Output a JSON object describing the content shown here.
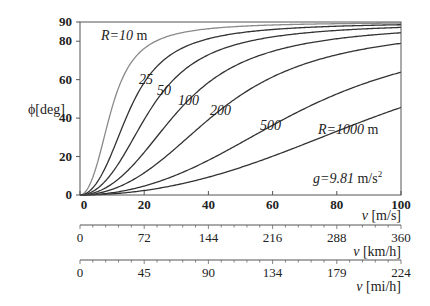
{
  "chart_data": {
    "type": "line",
    "title": "",
    "formula": "phi = atan(v^2 / (g R))",
    "xlabel": "v [m/s]",
    "ylabel": "ϕ[deg]",
    "xlim": [
      0,
      100
    ],
    "ylim": [
      0,
      90
    ],
    "x_ticks": [
      "0",
      "20",
      "40",
      "60",
      "80",
      "100"
    ],
    "y_ticks": [
      "0",
      "20",
      "40",
      "60",
      "80",
      "90"
    ],
    "secondary_axes": [
      {
        "label": "v [km/h]",
        "ticks": [
          "0",
          "72",
          "144",
          "216",
          "288",
          "360"
        ]
      },
      {
        "label": "v [mi/h]",
        "ticks": [
          "0",
          "45",
          "90",
          "134",
          "179",
          "224"
        ]
      }
    ],
    "constant_annotation": "g=9.81 m/s²",
    "g": 9.81,
    "grid": false,
    "series": [
      {
        "name": "R=10 m",
        "R": 10,
        "label": "R=10 m",
        "color": "#8a8a8a"
      },
      {
        "name": "25",
        "R": 25,
        "label": "25",
        "color": "#333333"
      },
      {
        "name": "50",
        "R": 50,
        "label": "50",
        "color": "#333333"
      },
      {
        "name": "100",
        "R": 100,
        "label": "100",
        "color": "#333333"
      },
      {
        "name": "200",
        "R": 200,
        "label": "200",
        "color": "#333333"
      },
      {
        "name": "500",
        "R": 500,
        "label": "500",
        "color": "#333333"
      },
      {
        "name": "R=1000 m",
        "R": 1000,
        "label": "R=1000 m",
        "color": "#333333"
      }
    ],
    "sample_values_deg_at_v100": {
      "10": 89.9,
      "25": 89.8,
      "50": 89.7,
      "100": 89.4,
      "200": 88.9,
      "500": 87.2,
      "1000": 45.5
    }
  },
  "labels": {
    "ylabel": "ϕ[deg]",
    "xlabel_ms": "v [m/s]",
    "xlabel_kmh": "v [km/h]",
    "xlabel_mih": "v [mi/h]",
    "r10": "R=10 m",
    "r25": "25",
    "r50": "50",
    "r100": "100",
    "r200": "200",
    "r500": "500",
    "r1000": "R=1000 m",
    "g": "g=9.81 m/s²"
  }
}
